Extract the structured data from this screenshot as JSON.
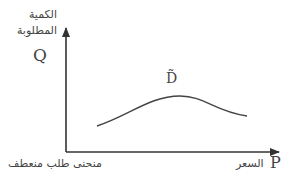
{
  "diagram": {
    "y_axis": {
      "label_ar_line1": "الكمية",
      "label_ar_line2": "المطلوبة",
      "symbol": "Q"
    },
    "x_axis": {
      "label_ar": "السعر",
      "symbol": "P"
    },
    "curve": {
      "label": "D̃"
    },
    "caption": "منحنى طلب منعطف"
  },
  "colors": {
    "axis": "#333333",
    "curve": "#444444",
    "text": "#444444"
  }
}
